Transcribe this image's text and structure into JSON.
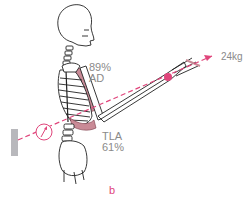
{
  "figure": {
    "panel_label": "b",
    "muscles": {
      "ad": {
        "percent": "89%",
        "abbr": "AD"
      },
      "tla": {
        "abbr": "TLA",
        "percent": "61%"
      }
    },
    "load": {
      "value": "24kg"
    },
    "colors": {
      "accent": "#e0457b",
      "muscle_fill": "#c98a96",
      "bone_stroke": "#222222",
      "label_text": "#8a8a8a",
      "wall": "#b8b8bc"
    }
  }
}
